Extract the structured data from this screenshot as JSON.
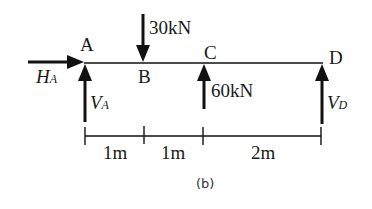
{
  "diagram": {
    "type": "beam-free-body-diagram",
    "points": [
      {
        "id": "A",
        "label": "A"
      },
      {
        "id": "B",
        "label": "B"
      },
      {
        "id": "C",
        "label": "C"
      },
      {
        "id": "D",
        "label": "D"
      }
    ],
    "loads": [
      {
        "at": "B",
        "direction": "down",
        "label": "30kN"
      },
      {
        "at": "C",
        "direction": "up",
        "label": "60kN"
      }
    ],
    "reactions": [
      {
        "at": "A",
        "direction": "right",
        "symbol": "H",
        "subscript": "A"
      },
      {
        "at": "A",
        "direction": "up",
        "symbol": "V",
        "subscript": "A"
      },
      {
        "at": "D",
        "direction": "up",
        "symbol": "V",
        "subscript": "D"
      }
    ],
    "dimensions": [
      {
        "from": "A",
        "to": "B",
        "label": "1m"
      },
      {
        "from": "B",
        "to": "C",
        "label": "1m"
      },
      {
        "from": "C",
        "to": "D",
        "label": "2m"
      }
    ],
    "caption": "(b)"
  }
}
